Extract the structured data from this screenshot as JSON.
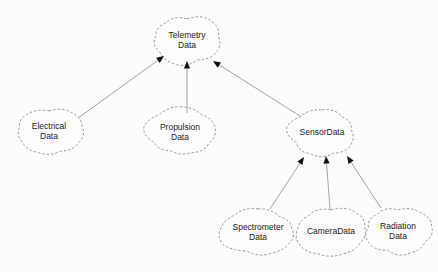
{
  "diagram": {
    "type": "dependency-graph",
    "background_color": "#fcfcfc",
    "node_shape": "cloud",
    "node_border_style": "dashed",
    "node_border_color": "#8a8a8a",
    "edge_color": "#9a9a9a",
    "arrow_color": "#111111",
    "label_color": "#222222",
    "nodes": [
      {
        "id": "telemetry",
        "label_line1": "Telemetry",
        "label_line2": "Data",
        "cx": 187,
        "cy": 40,
        "rx": 33,
        "ry": 23
      },
      {
        "id": "electrical",
        "label_line1": "Electrical",
        "label_line2": "Data",
        "cx": 49,
        "cy": 131,
        "rx": 33,
        "ry": 23
      },
      {
        "id": "propulsion",
        "label_line1": "Propulsion",
        "label_line2": "Data",
        "cx": 180,
        "cy": 132,
        "rx": 33,
        "ry": 23
      },
      {
        "id": "sensordata",
        "label_line1": "SensorData",
        "label_line2": "",
        "cx": 322,
        "cy": 133,
        "rx": 34,
        "ry": 22
      },
      {
        "id": "spectrometer",
        "label_line1": "Spectrometer",
        "label_line2": "Data",
        "cx": 258,
        "cy": 232,
        "rx": 37,
        "ry": 23
      },
      {
        "id": "cameradata",
        "label_line1": "CameraData",
        "label_line2": "",
        "cx": 331,
        "cy": 232,
        "rx": 35,
        "ry": 23
      },
      {
        "id": "radiation",
        "label_line1": "Radiation",
        "label_line2": "Data",
        "cx": 398,
        "cy": 231,
        "rx": 33,
        "ry": 23
      },
      {
        "id": "telemetry-dup",
        "label_line1": "",
        "label_line2": "",
        "cx": -999,
        "cy": -999,
        "rx": 0,
        "ry": 0
      }
    ],
    "edges": [
      {
        "id": "electrical-to-telemetry",
        "from": "electrical",
        "to": "telemetry",
        "x1": 78,
        "y1": 118,
        "x2": 164,
        "y2": 56
      },
      {
        "id": "propulsion-to-telemetry",
        "from": "propulsion",
        "to": "telemetry",
        "x1": 187,
        "y1": 113,
        "x2": 187,
        "y2": 61
      },
      {
        "id": "sensordata-to-telemetry",
        "from": "sensordata",
        "to": "telemetry",
        "x1": 300,
        "y1": 116,
        "x2": 213,
        "y2": 61
      },
      {
        "id": "spectrometer-to-sensordata",
        "from": "spectrometer",
        "to": "sensordata",
        "x1": 270,
        "y1": 209,
        "x2": 304,
        "y2": 157
      },
      {
        "id": "cameradata-to-sensordata",
        "from": "cameradata",
        "to": "sensordata",
        "x1": 330,
        "y1": 209,
        "x2": 326,
        "y2": 156
      },
      {
        "id": "radiation-to-sensordata",
        "from": "radiation",
        "to": "sensordata",
        "x1": 381,
        "y1": 208,
        "x2": 347,
        "y2": 156
      }
    ]
  }
}
